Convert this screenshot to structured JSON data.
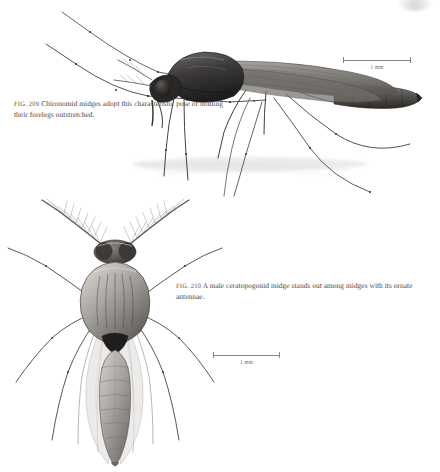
{
  "page": {
    "background_color": "#ffffff",
    "text_color": "#4a4742",
    "rule_color": "#8b8882"
  },
  "figures": [
    {
      "id": "fig-209",
      "number": "FIG. 209",
      "caption": "Chironomid midges adopt this characteristic pose of holding their forelegs outstretched.",
      "subject": "chironomid-midge-lateral",
      "view": "lateral",
      "scalebar": {
        "label": "1 mm",
        "length_px": 68
      }
    },
    {
      "id": "fig-210",
      "number": "FIG. 210",
      "caption": "A male ceratopogonid midge stands out among midges with its ornate antennae.",
      "subject": "ceratopogonid-midge-dorsal",
      "view": "dorsal",
      "scalebar": {
        "label": "1 mm",
        "length_px": 67
      }
    }
  ],
  "icons": {
    "corner_smudge": "corner-smudge-artifact"
  }
}
